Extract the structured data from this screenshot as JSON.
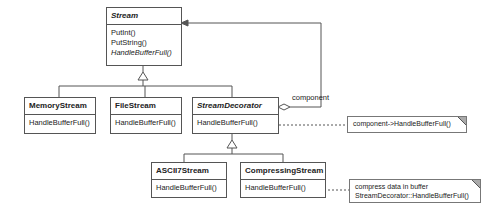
{
  "diagram": {
    "classes": [
      {
        "id": "stream",
        "name": "Stream",
        "abstract": true,
        "operations": [
          {
            "label": "PutInt()",
            "italic": false
          },
          {
            "label": "PutString()",
            "italic": false
          },
          {
            "label": "HandleBufferFull()",
            "italic": true
          }
        ]
      },
      {
        "id": "memory_stream",
        "name": "MemoryStream",
        "abstract": false,
        "operations": [
          {
            "label": "HandleBufferFull()",
            "italic": false
          }
        ]
      },
      {
        "id": "file_stream",
        "name": "FileStream",
        "abstract": false,
        "operations": [
          {
            "label": "HandleBufferFull()",
            "italic": false
          }
        ]
      },
      {
        "id": "stream_decorator",
        "name": "StreamDecorator",
        "abstract": true,
        "operations": [
          {
            "label": "HandleBufferFull()",
            "italic": false
          }
        ]
      },
      {
        "id": "ascii7_stream",
        "name": "ASCII7Stream",
        "abstract": false,
        "operations": [
          {
            "label": "HandleBufferFull()",
            "italic": false
          }
        ]
      },
      {
        "id": "compressing_stream",
        "name": "CompressingStream",
        "abstract": false,
        "operations": [
          {
            "label": "HandleBufferFull()",
            "italic": false
          }
        ]
      }
    ],
    "association_label": "component",
    "notes": [
      {
        "id": "note_decorator",
        "lines": [
          "component->HandleBufferFull()"
        ]
      },
      {
        "id": "note_compressing",
        "lines": [
          "compress data in buffer",
          "StreamDecorator::HandleBufferFull()"
        ]
      }
    ],
    "relationships": [
      {
        "type": "generalization",
        "parent": "Stream",
        "children": [
          "MemoryStream",
          "FileStream",
          "StreamDecorator"
        ]
      },
      {
        "type": "generalization",
        "parent": "StreamDecorator",
        "children": [
          "ASCII7Stream",
          "CompressingStream"
        ]
      },
      {
        "type": "aggregation",
        "from": "StreamDecorator",
        "to": "Stream",
        "label": "component"
      }
    ]
  }
}
